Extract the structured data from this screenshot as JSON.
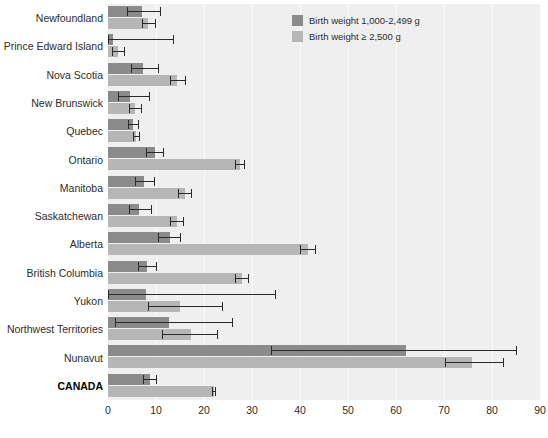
{
  "chart_data": {
    "type": "bar",
    "orientation": "horizontal",
    "title": "",
    "xlabel": "",
    "ylabel": "",
    "xlim": [
      0,
      90
    ],
    "xticks": [
      0,
      10,
      20,
      30,
      40,
      50,
      60,
      70,
      80,
      90
    ],
    "grid": true,
    "legend_position": "top-right",
    "categories": [
      "Newfoundland",
      "Prince Edward Island",
      "Nova Scotia",
      "New Brunswick",
      "Quebec",
      "Ontario",
      "Manitoba",
      "Saskatchewan",
      "Alberta",
      "British Columbia",
      "Yukon",
      "Northwest Territories",
      "Nunavut",
      "CANADA"
    ],
    "emphasized_categories": [
      "CANADA"
    ],
    "series": [
      {
        "name": "Birth weight 1,000-2,499 g",
        "color": "#8b8b8b",
        "values": [
          7.1,
          1.0,
          7.3,
          4.6,
          5.2,
          9.8,
          7.5,
          6.5,
          12.9,
          8.1,
          7.9,
          12.7,
          62.1,
          8.8
        ],
        "error_low": [
          4.0,
          0.0,
          4.7,
          2.0,
          4.2,
          7.9,
          5.6,
          4.4,
          10.5,
          6.3,
          0.0,
          1.5,
          33.9,
          7.2
        ],
        "error_high": [
          11.0,
          13.8,
          10.6,
          8.7,
          6.5,
          11.6,
          9.7,
          9.1,
          15.2,
          10.3,
          35.1,
          26.1,
          85.3,
          10.3
        ]
      },
      {
        "name": "Birth weight ≥ 2,500 g",
        "color": "#b6b6b6",
        "values": [
          8.3,
          2.1,
          14.4,
          5.6,
          5.8,
          27.5,
          16.0,
          14.3,
          41.7,
          27.9,
          15.0,
          17.3,
          75.8,
          22.1
        ],
        "error_low": [
          7.1,
          0.8,
          12.9,
          4.4,
          5.2,
          26.4,
          14.6,
          13.0,
          40.1,
          26.5,
          8.4,
          11.2,
          70.2,
          21.6
        ],
        "error_high": [
          10.0,
          3.5,
          16.2,
          7.1,
          6.6,
          28.5,
          17.6,
          15.8,
          43.4,
          29.3,
          24.0,
          23.0,
          82.4,
          22.6
        ]
      }
    ]
  },
  "legend": {
    "items": [
      {
        "label": "Birth weight 1,000-2,499 g",
        "swatch": "dark"
      },
      {
        "label": "Birth weight ≥ 2,500 g",
        "swatch": "light"
      }
    ]
  }
}
